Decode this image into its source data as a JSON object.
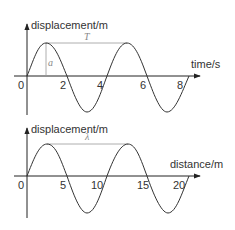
{
  "diagrams": [
    {
      "id": "time-graph",
      "y_axis_label": "displacement/m",
      "x_axis_label": "time/s",
      "tick_labels": [
        "0",
        "2",
        "4",
        "6",
        "8"
      ],
      "period_label": "T",
      "amplitude_label": "a"
    },
    {
      "id": "distance-graph",
      "y_axis_label": "displacement/m",
      "x_axis_label": "distance/m",
      "tick_labels": [
        "0",
        "5",
        "10",
        "15",
        "20"
      ],
      "wavelength_label": "λ"
    }
  ],
  "colors": {
    "axis": "#222222",
    "wave": "#333333",
    "guide": "#999999",
    "symbol": "#888888"
  }
}
